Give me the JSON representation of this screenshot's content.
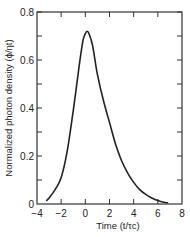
{
  "chart_data": {
    "type": "line",
    "title": "",
    "xlabel": "Time (t/τc)",
    "ylabel": "Normalized photon density (ϕ/ηt)",
    "xlim": [
      -4,
      8
    ],
    "ylim": [
      0,
      0.8
    ],
    "x_ticks": [
      -4,
      -2,
      0,
      2,
      4,
      6,
      8
    ],
    "x_tick_labels": [
      "−4",
      "−2",
      "0",
      "2",
      "4",
      "6",
      "8"
    ],
    "y_ticks": [
      0,
      0.2,
      0.4,
      0.6,
      0.8
    ],
    "y_tick_labels": [
      "0",
      "0.2",
      "0.4",
      "0.6",
      "0.8"
    ],
    "grid": false,
    "legend": null,
    "series": [
      {
        "name": "photon density",
        "x": [
          -3.2,
          -3.0,
          -2.5,
          -2.0,
          -1.5,
          -1.0,
          -0.5,
          -0.2,
          0.0,
          0.15,
          0.3,
          0.6,
          1.0,
          1.5,
          2.0,
          2.5,
          3.0,
          3.5,
          4.0,
          4.5,
          5.0,
          5.5,
          6.0,
          6.5,
          6.8
        ],
        "y": [
          0.015,
          0.025,
          0.06,
          0.11,
          0.22,
          0.39,
          0.58,
          0.68,
          0.71,
          0.72,
          0.71,
          0.66,
          0.54,
          0.43,
          0.34,
          0.25,
          0.18,
          0.13,
          0.09,
          0.06,
          0.04,
          0.025,
          0.014,
          0.007,
          0.005
        ]
      }
    ]
  }
}
